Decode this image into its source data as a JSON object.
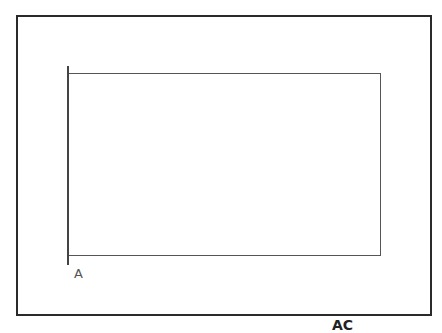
{
  "diagram": {
    "shapes": [
      {
        "type": "rectangle",
        "role": "outer-frame"
      },
      {
        "type": "rectangle",
        "role": "inner-rectangle",
        "open_side": "left"
      },
      {
        "type": "line",
        "role": "left-vertical-line"
      }
    ],
    "labels": {
      "point_a": "A",
      "bottom_cut_label": "AC"
    },
    "colors": {
      "frame": "#2a2a2a",
      "line": "#555555",
      "background": "#ffffff"
    }
  }
}
